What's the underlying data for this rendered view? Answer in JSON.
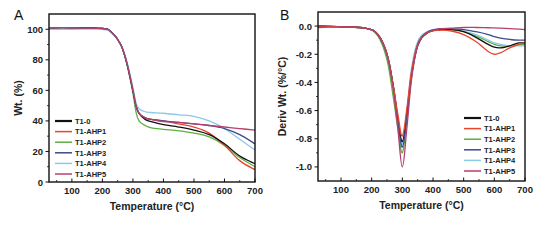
{
  "chart_data": [
    {
      "panel": "A",
      "type": "line",
      "title": "",
      "xlabel": "Temperature (°C)",
      "ylabel": "Wt. (%)",
      "xlim": [
        25,
        700
      ],
      "ylim": [
        0,
        110
      ],
      "xticks": [
        100,
        200,
        300,
        400,
        500,
        600,
        700
      ],
      "yticks": [
        0,
        20,
        40,
        60,
        80,
        100
      ],
      "grid": false,
      "legend_position": "lower left",
      "x": [
        25,
        100,
        200,
        230,
        260,
        280,
        300,
        310,
        320,
        340,
        360,
        400,
        450,
        500,
        550,
        600,
        650,
        700
      ],
      "series": [
        {
          "name": "T1-0",
          "color": "#111111",
          "values": [
            101,
            101,
            100.5,
            98,
            90,
            78,
            60,
            50,
            45,
            41,
            39.5,
            37.5,
            36,
            34,
            31,
            25,
            17,
            12
          ]
        },
        {
          "name": "T1-AHP1",
          "color": "#e8452c",
          "values": [
            101,
            101,
            100.5,
            98,
            90,
            78,
            60,
            50,
            45,
            42,
            41,
            40,
            38,
            36,
            32,
            24,
            14,
            8
          ]
        },
        {
          "name": "T1-AHP2",
          "color": "#5cb040",
          "values": [
            101,
            101,
            100.5,
            98,
            90,
            77,
            58,
            46,
            40,
            37,
            35.5,
            34.5,
            33.5,
            32,
            29.5,
            24,
            16,
            10
          ]
        },
        {
          "name": "T1-AHP3",
          "color": "#3d4a8c",
          "values": [
            101,
            101,
            100.5,
            98,
            90,
            78,
            60,
            50,
            45,
            42,
            41,
            40,
            39,
            38,
            37,
            35,
            31,
            25
          ]
        },
        {
          "name": "T1-AHP4",
          "color": "#8cc8e8",
          "values": [
            100,
            100,
            100,
            97.5,
            90,
            79,
            62,
            52,
            48,
            46,
            45.5,
            45,
            44,
            43,
            40,
            35,
            28,
            21
          ]
        },
        {
          "name": "T1-AHP5",
          "color": "#b5406e",
          "values": [
            101,
            101,
            100.5,
            98,
            90,
            78,
            60,
            50,
            45,
            42,
            41,
            39.5,
            39,
            38,
            37,
            36,
            35,
            34
          ]
        }
      ]
    },
    {
      "panel": "B",
      "type": "line",
      "title": "",
      "xlabel": "Temperature (°C)",
      "ylabel": "Deriv Wt. (%/°C)",
      "xlim": [
        25,
        700
      ],
      "ylim": [
        -1.1,
        0.1
      ],
      "xticks": [
        100,
        200,
        300,
        400,
        500,
        600,
        700
      ],
      "yticks": [
        0.0,
        -0.2,
        -0.4,
        -0.6,
        -0.8,
        -1.0
      ],
      "grid": false,
      "legend_position": "lower right",
      "x": [
        25,
        100,
        180,
        220,
        250,
        270,
        285,
        300,
        315,
        330,
        350,
        380,
        420,
        460,
        500,
        540,
        580,
        600,
        620,
        650,
        680,
        700
      ],
      "series": [
        {
          "name": "T1-0",
          "color": "#111111",
          "values": [
            0,
            -0.005,
            -0.015,
            -0.06,
            -0.2,
            -0.42,
            -0.65,
            -0.82,
            -0.62,
            -0.35,
            -0.14,
            -0.05,
            -0.025,
            -0.025,
            -0.04,
            -0.08,
            -0.13,
            -0.15,
            -0.155,
            -0.14,
            -0.12,
            -0.12
          ]
        },
        {
          "name": "T1-AHP1",
          "color": "#e8452c",
          "values": [
            0,
            -0.005,
            -0.015,
            -0.06,
            -0.2,
            -0.42,
            -0.62,
            -0.78,
            -0.58,
            -0.32,
            -0.13,
            -0.05,
            -0.03,
            -0.035,
            -0.06,
            -0.11,
            -0.18,
            -0.2,
            -0.19,
            -0.155,
            -0.13,
            -0.12
          ]
        },
        {
          "name": "T1-AHP2",
          "color": "#5cb040",
          "values": [
            0,
            -0.005,
            -0.015,
            -0.07,
            -0.24,
            -0.5,
            -0.72,
            -0.9,
            -0.66,
            -0.36,
            -0.14,
            -0.05,
            -0.025,
            -0.025,
            -0.04,
            -0.07,
            -0.11,
            -0.13,
            -0.14,
            -0.14,
            -0.135,
            -0.13
          ]
        },
        {
          "name": "T1-AHP3",
          "color": "#3d4a8c",
          "values": [
            0,
            -0.005,
            -0.015,
            -0.06,
            -0.2,
            -0.42,
            -0.66,
            -0.86,
            -0.64,
            -0.34,
            -0.13,
            -0.045,
            -0.02,
            -0.02,
            -0.025,
            -0.04,
            -0.06,
            -0.075,
            -0.085,
            -0.095,
            -0.1,
            -0.1
          ]
        },
        {
          "name": "T1-AHP4",
          "color": "#8cc8e8",
          "values": [
            0,
            -0.005,
            -0.015,
            -0.06,
            -0.2,
            -0.42,
            -0.66,
            -0.84,
            -0.6,
            -0.3,
            -0.11,
            -0.04,
            -0.02,
            -0.02,
            -0.035,
            -0.06,
            -0.1,
            -0.12,
            -0.13,
            -0.14,
            -0.14,
            -0.14
          ]
        },
        {
          "name": "T1-AHP5",
          "color": "#b5406e",
          "values": [
            -0.01,
            -0.005,
            -0.015,
            -0.06,
            -0.2,
            -0.45,
            -0.72,
            -1.0,
            -0.72,
            -0.38,
            -0.14,
            -0.05,
            -0.02,
            -0.015,
            -0.01,
            -0.01,
            -0.012,
            -0.013,
            -0.015,
            -0.018,
            -0.022,
            -0.025
          ]
        }
      ]
    }
  ],
  "panels": {
    "a": {
      "letter": "A",
      "ylabel": "Wt. (%)",
      "xlabel": "Temperature (°C)"
    },
    "b": {
      "letter": "B",
      "ylabel": "Deriv Wt. (%/°C)",
      "xlabel": "Temperature (°C)"
    }
  },
  "legend": [
    "T1-0",
    "T1-AHP1",
    "T1-AHP2",
    "T1-AHP3",
    "T1-AHP4",
    "T1-AHP5"
  ]
}
